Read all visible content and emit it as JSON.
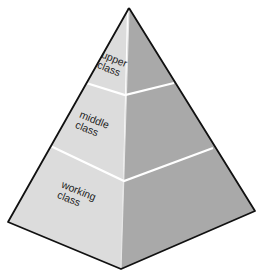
{
  "diagram": {
    "type": "stratified-pyramid",
    "colors": {
      "left_face": "#dcdcdc",
      "right_face": "#a9a9a9",
      "outline": "#111111",
      "divider": "#ffffff",
      "text": "#1e1e1e"
    },
    "tiers": [
      {
        "id": "upper",
        "line1": "upper",
        "line2": "class"
      },
      {
        "id": "middle",
        "line1": "middle",
        "line2": "class"
      },
      {
        "id": "working",
        "line1": "working",
        "line2": "class"
      }
    ]
  }
}
